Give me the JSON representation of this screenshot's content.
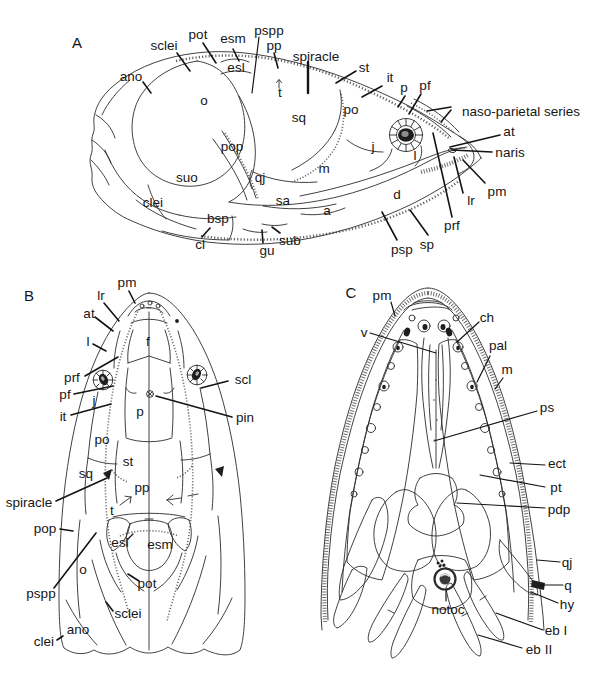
{
  "figure": {
    "background": "#ffffff",
    "ink": "#1f1f1f"
  },
  "panelA": {
    "letter": "A",
    "labels": {
      "ano": "ano",
      "sclei": "sclei",
      "pot": "pot",
      "esm": "esm",
      "pspp": "pspp",
      "pp": "pp",
      "esl": "esl",
      "spiracle": "spiracle",
      "st": "st",
      "it": "it",
      "p": "p",
      "pf": "pf",
      "naso_parietal_series": "naso-parietal series",
      "at": "at",
      "naris": "naris",
      "pm": "pm",
      "lr": "lr",
      "prf": "prf",
      "sp": "sp",
      "psp": "psp",
      "d": "d",
      "o": "o",
      "sq": "sq",
      "po": "po",
      "j": "j",
      "l": "l",
      "m": "m",
      "sa": "sa",
      "a": "a",
      "qj": "qj",
      "pop": "pop",
      "suo": "suo",
      "clei": "clei",
      "bsp": "bsp",
      "cl": "cl",
      "gu": "gu",
      "sub": "sub",
      "t": "t"
    }
  },
  "panelB": {
    "letter": "B",
    "labels": {
      "pm": "pm",
      "lr": "lr",
      "at": "at",
      "l": "l",
      "prf": "prf",
      "pf": "pf",
      "it": "it",
      "j": "j",
      "f": "f",
      "p": "p",
      "scl": "scl",
      "pin": "pin",
      "po": "po",
      "st": "st",
      "sq": "sq",
      "spiracle": "spiracle",
      "pop": "pop",
      "pspp": "pspp",
      "o": "o",
      "pot": "pot",
      "sclei": "sclei",
      "ano": "ano",
      "clei": "clei",
      "esl": "esl",
      "esm": "esm",
      "pp": "pp",
      "t": "t"
    }
  },
  "panelC": {
    "letter": "C",
    "labels": {
      "pm": "pm",
      "v": "v",
      "ch": "ch",
      "pal": "pal",
      "m": "m",
      "ps": "ps",
      "ect": "ect",
      "pt": "pt",
      "pdp": "pdp",
      "qj": "qj",
      "q": "q",
      "hy": "hy",
      "notoc": "notoc",
      "eb_i": "eb I",
      "eb_ii": "eb II"
    }
  }
}
